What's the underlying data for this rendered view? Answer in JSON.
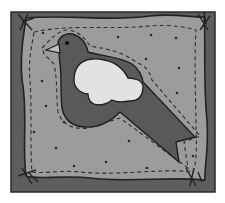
{
  "illustration": {
    "subject": "bird-quilt-patch",
    "colors": {
      "background": "#ffffff",
      "frame": "#5e5e5e",
      "fabric": "#9c9c9c",
      "bird": "#595959",
      "wing": "#e2e2e2",
      "beak": "#bdbdbd",
      "outline": "#222222",
      "stitch": "#2e2e2e",
      "dot": "#2a2a2a"
    },
    "dots": [
      [
        43,
        33
      ],
      [
        118,
        37
      ],
      [
        151,
        35
      ],
      [
        176,
        38
      ],
      [
        146,
        59
      ],
      [
        179,
        68
      ],
      [
        42,
        81
      ],
      [
        177,
        93
      ],
      [
        46,
        106
      ],
      [
        64,
        122
      ],
      [
        34,
        132
      ],
      [
        129,
        141
      ],
      [
        56,
        148
      ],
      [
        193,
        156
      ],
      [
        106,
        162
      ],
      [
        74,
        166
      ],
      [
        147,
        168
      ]
    ]
  }
}
